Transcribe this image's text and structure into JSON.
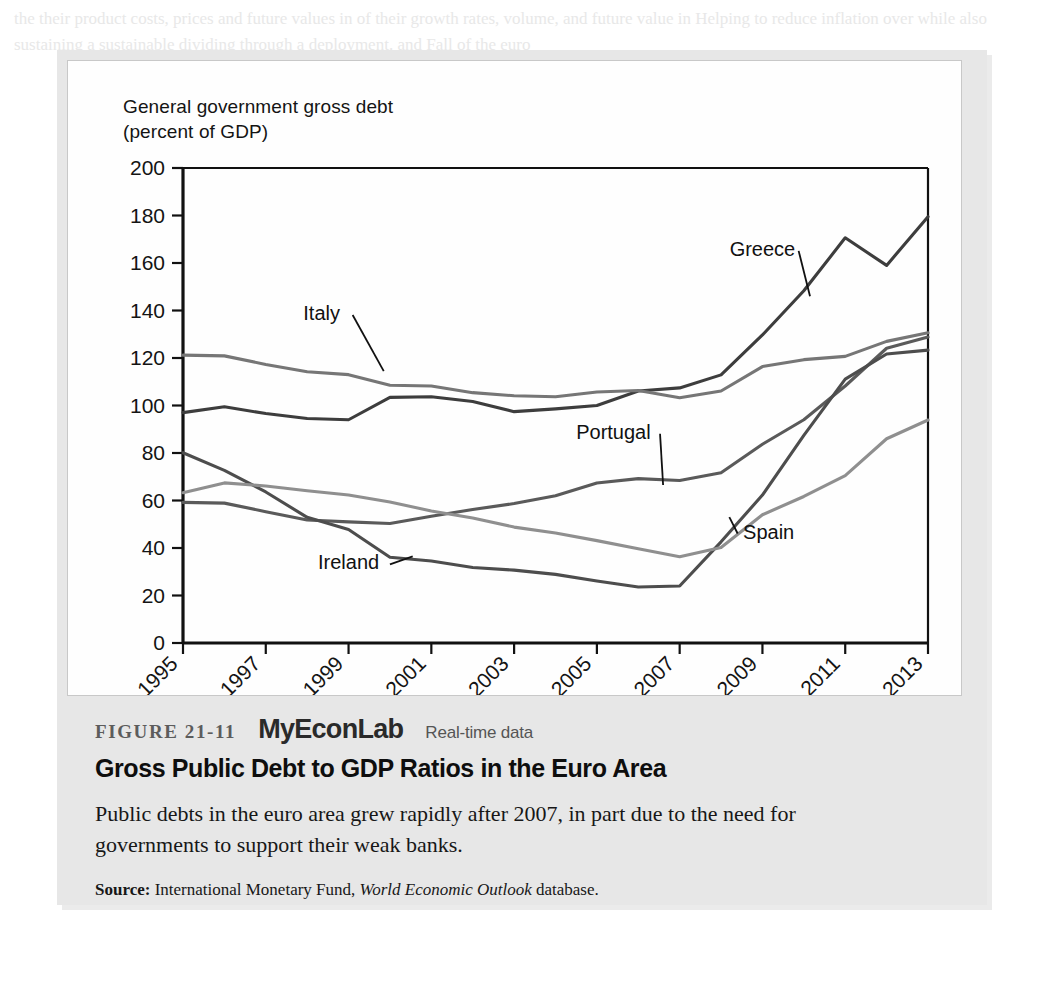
{
  "figure": {
    "number_label": "FIGURE 21-11",
    "brand": "MyEconLab",
    "brand_tag": "Real-time data",
    "title": "Gross Public Debt to GDP Ratios in the Euro Area",
    "description": "Public debts in the euro area grew rapidly after 2007, in part due to the need for governments to support their weak banks.",
    "source_label": "Source:",
    "source_pre": "International Monetary Fund,",
    "source_italic": "World Economic Outlook",
    "source_post": "database."
  },
  "chart_data": {
    "type": "line",
    "title": "",
    "axis_caption_line1": "General government gross debt",
    "axis_caption_line2": "(percent of GDP)",
    "ylabel": "General government gross debt (percent of GDP)",
    "xlabel": "",
    "ylim": [
      0,
      200
    ],
    "ytick_step": 20,
    "yticks": [
      0,
      20,
      40,
      60,
      80,
      100,
      120,
      140,
      160,
      180,
      200
    ],
    "x": [
      1995,
      1996,
      1997,
      1998,
      1999,
      2000,
      2001,
      2002,
      2003,
      2004,
      2005,
      2006,
      2007,
      2008,
      2009,
      2010,
      2011,
      2012,
      2013
    ],
    "xticks": [
      1995,
      1997,
      1999,
      2001,
      2003,
      2005,
      2007,
      2009,
      2011,
      2013
    ],
    "xtick_labels": [
      "1995",
      "1997",
      "1999",
      "2001",
      "2003",
      "2005",
      "2007",
      "2009",
      "2011",
      "2013"
    ],
    "xlim": [
      1995,
      2013
    ],
    "grid": false,
    "legend": "inline-annotations",
    "series": [
      {
        "name": "Greece",
        "color": "#3d3d3d",
        "label_x": 2009.0,
        "label_y": 163,
        "leader_to_x": 2010.15,
        "leader_to_y": 146,
        "values": [
          97,
          99.5,
          96.6,
          94.5,
          94.0,
          103.4,
          103.7,
          101.7,
          97.4,
          98.6,
          100.0,
          106.1,
          107.4,
          112.9,
          129.7,
          148.3,
          170.6,
          159.0,
          179.5
        ]
      },
      {
        "name": "Italy",
        "color": "#767676",
        "label_x": 1998.35,
        "label_y": 136,
        "leader_to_x": 1999.85,
        "leader_to_y": 114.5,
        "values": [
          121.2,
          120.9,
          117.3,
          114.2,
          113.0,
          108.5,
          108.2,
          105.4,
          104.1,
          103.7,
          105.7,
          106.3,
          103.3,
          106.1,
          116.4,
          119.3,
          120.7,
          127.0,
          130.6
        ]
      },
      {
        "name": "Portugal",
        "color": "#5a5a5a",
        "label_x": 2005.4,
        "label_y": 86,
        "leader_to_x": 2006.6,
        "leader_to_y": 66.5,
        "values": [
          59.2,
          58.9,
          55.3,
          51.8,
          51.0,
          50.3,
          53.4,
          56.2,
          58.7,
          62.0,
          67.4,
          69.2,
          68.4,
          71.7,
          83.7,
          94.0,
          108.2,
          124.1,
          128.8
        ]
      },
      {
        "name": "Ireland",
        "color": "#4d4d4d",
        "label_x": 1999.0,
        "label_y": 31,
        "leader_to_x": 2000.55,
        "leader_to_y": 36.5,
        "values": [
          80.1,
          72.7,
          63.6,
          52.9,
          47.8,
          36.1,
          34.5,
          31.8,
          30.7,
          28.9,
          26.1,
          23.6,
          24.0,
          42.6,
          62.3,
          87.4,
          111.1,
          121.7,
          123.3
        ]
      },
      {
        "name": "Spain",
        "color": "#8f8f8f",
        "label_x": 2009.15,
        "label_y": 44,
        "leader_to_x": 2008.2,
        "leader_to_y": 53,
        "values": [
          63.3,
          67.4,
          66.1,
          64.1,
          62.3,
          59.4,
          55.6,
          52.6,
          48.8,
          46.3,
          43.1,
          39.7,
          36.3,
          40.2,
          54.0,
          61.7,
          70.5,
          86.0,
          93.9
        ]
      }
    ]
  },
  "bleed_text": "the their product costs, prices and future values in of their growth rates, volume, and future value in Helping to reduce inflation over while also sustaining a sustainable dividing through a deployment. and Fall of the euro"
}
